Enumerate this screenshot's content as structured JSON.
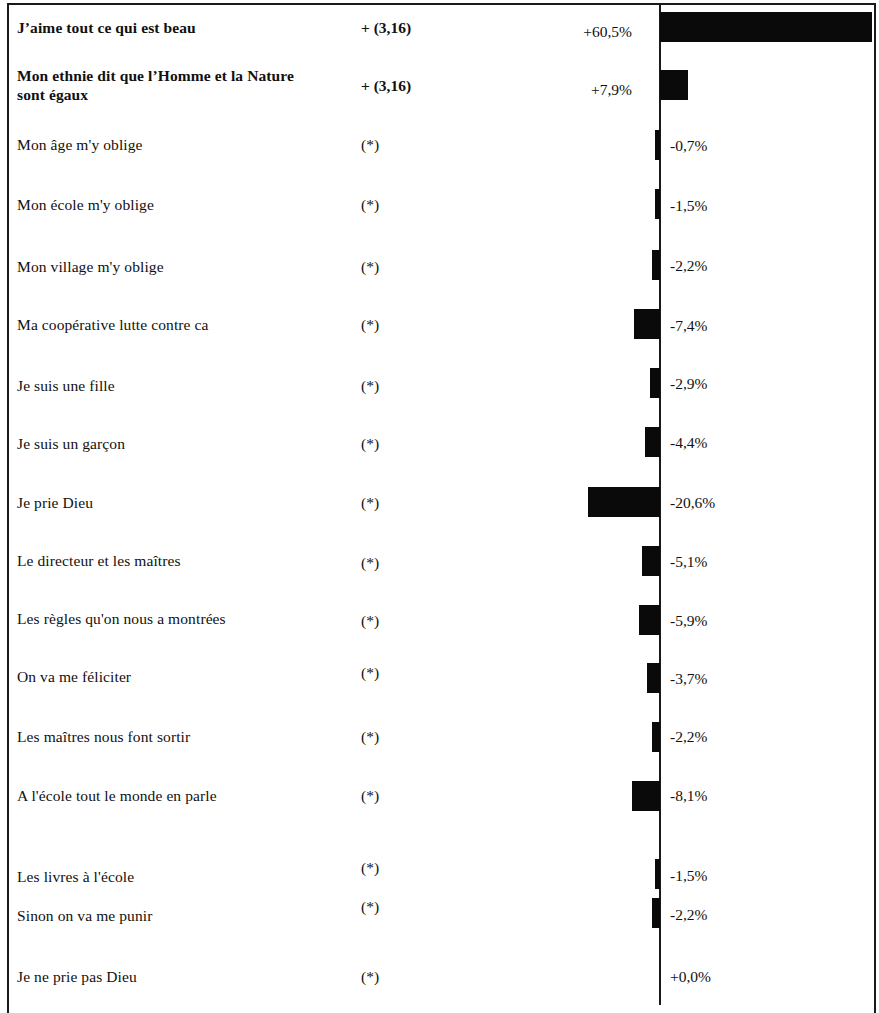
{
  "chart_data": {
    "type": "bar",
    "title": "",
    "subtitle": "",
    "xlabel": "",
    "ylabel": "",
    "orientation": "horizontal",
    "axis": {
      "zero_line": true,
      "grid": false,
      "xlim": [
        -20.6,
        60.5
      ]
    },
    "legend": {
      "position": "none",
      "entries": []
    },
    "columns": [
      "Item",
      "Significance",
      "Value"
    ],
    "categories": [
      "J’aime tout ce qui est beau",
      "Mon ethnie dit que l’Homme et la Nature sont égaux",
      "Mon âge m'y oblige",
      "Mon école m'y oblige",
      "Mon village m'y oblige",
      "Ma coopérative lutte contre ca",
      "Je suis une fille",
      "Je suis un garçon",
      "Je prie Dieu",
      "Le directeur et les maîtres",
      "Les règles qu'on nous a montrées",
      "On va me féliciter",
      "Les maîtres nous font sortir",
      "A l'école tout le monde en parle",
      "Les livres à l'école",
      "Sinon on va me punir",
      "Je ne prie pas Dieu"
    ],
    "values": [
      60.5,
      7.9,
      -0.7,
      -1.5,
      -2.2,
      -7.4,
      -2.9,
      -4.4,
      -20.6,
      -5.1,
      -5.9,
      -3.7,
      -2.2,
      -8.1,
      -1.5,
      -2.2,
      0.0
    ],
    "value_labels": [
      "+60,5%",
      "+7,9%",
      "-0,7%",
      "-1,5%",
      "-2,2%",
      "-7,4%",
      "-2,9%",
      "-4,4%",
      "-20,6%",
      "-5,1%",
      "-5,9%",
      "-3,7%",
      "-2,2%",
      "-8,1%",
      "-1,5%",
      "-2,2%",
      "+0,0%"
    ],
    "significance": [
      "+  (3,16)",
      "+  (3,16)",
      "(*)",
      "(*)",
      "(*)",
      "(*)",
      "(*)",
      "(*)",
      "(*)",
      "(*)",
      "(*)",
      "(*)",
      "(*)",
      "(*)",
      "(*)",
      "(*)",
      "(*)"
    ]
  },
  "rows": [
    {
      "label": "J’aime tout ce qui est beau",
      "label_line2": "",
      "significance": "+  (3,16)",
      "value_label": "+60,5%",
      "bar_label": "",
      "bold": true
    },
    {
      "label": "Mon ethnie dit que l’Homme et la Nature",
      "label_line2": "sont égaux",
      "significance": "+  (3,16)",
      "value_label": "+7,9%",
      "bar_label": "",
      "bold": true
    },
    {
      "label": "Mon âge m'y oblige",
      "label_line2": "",
      "significance": "(*)",
      "value_label": "",
      "bar_label": "-0,7%",
      "bold": false
    },
    {
      "label": "Mon école m'y oblige",
      "label_line2": "",
      "significance": "(*)",
      "value_label": "",
      "bar_label": "-1,5%",
      "bold": false
    },
    {
      "label": "Mon village m'y oblige",
      "label_line2": "",
      "significance": "(*)",
      "value_label": "",
      "bar_label": "-2,2%",
      "bold": false
    },
    {
      "label": "Ma coopérative  lutte contre ca",
      "label_line2": "",
      "significance": "(*)",
      "value_label": "",
      "bar_label": "-7,4%",
      "bold": false
    },
    {
      "label": "Je suis une fille",
      "label_line2": "",
      "significance": "(*)",
      "value_label": "",
      "bar_label": "-2,9%",
      "bold": false
    },
    {
      "label": "Je suis un garçon",
      "label_line2": "",
      "significance": "(*)",
      "value_label": "",
      "bar_label": "-4,4%",
      "bold": false
    },
    {
      "label": "Je prie Dieu",
      "label_line2": "",
      "significance": "(*)",
      "value_label": "",
      "bar_label": "-20,6%",
      "bold": false
    },
    {
      "label": "Le directeur et les maîtres",
      "label_line2": "",
      "significance": "(*)",
      "value_label": "",
      "bar_label": "-5,1%",
      "bold": false
    },
    {
      "label": "Les règles qu'on nous a montrées",
      "label_line2": "",
      "significance": "(*)",
      "value_label": "",
      "bar_label": "-5,9%",
      "bold": false
    },
    {
      "label": "On va me féliciter",
      "label_line2": "",
      "significance": "(*)",
      "value_label": "",
      "bar_label": "-3,7%",
      "bold": false
    },
    {
      "label": "Les maîtres nous font sortir",
      "label_line2": "",
      "significance": "(*)",
      "value_label": "",
      "bar_label": "-2,2%",
      "bold": false
    },
    {
      "label": "A l'école tout le monde en parle",
      "label_line2": "",
      "significance": "(*)",
      "value_label": "",
      "bar_label": "-8,1%",
      "bold": false
    },
    {
      "label": "Les livres à l'école",
      "label_line2": "",
      "significance": "(*)",
      "value_label": "",
      "bar_label": "-1,5%",
      "bold": false
    },
    {
      "label": "Sinon on va me punir",
      "label_line2": "",
      "significance": "(*)",
      "value_label": "",
      "bar_label": "-2,2%",
      "bold": false
    },
    {
      "label": "Je ne prie pas Dieu",
      "label_line2": "",
      "significance": "(*)",
      "value_label": "",
      "bar_label": "+0,0%",
      "bold": false
    }
  ],
  "style": {
    "bar_color": "#0a0a0a",
    "text_color": "#111111",
    "border_color": "#1a1a1a",
    "background": "#ffffff"
  }
}
